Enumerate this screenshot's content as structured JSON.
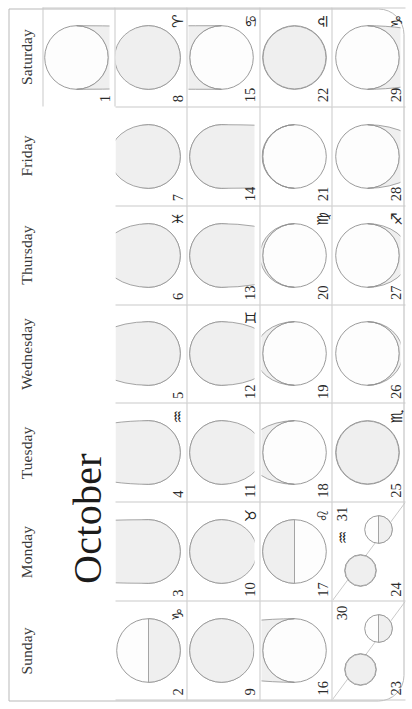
{
  "calendar": {
    "month": "October",
    "weekday_headers": [
      "Sunday",
      "Monday",
      "Tuesday",
      "Wednesday",
      "Thursday",
      "Friday",
      "Saturday"
    ],
    "colors": {
      "grid_line": "#c9c9c9",
      "page_border": "#b9b9b9",
      "moon_outline": "#8f8f8f",
      "moon_shadow_fill": "#efefef",
      "moon_lit_fill": "#fdfdfd",
      "text": "#2a2a2a"
    },
    "weeks": [
      {
        "index": 0,
        "days": [
          {
            "num": "",
            "zodiac": "",
            "blank": true,
            "illum": 0.0,
            "waxing": true,
            "shade": "none"
          },
          {
            "num": "",
            "zodiac": "",
            "blank": true,
            "illum": 0.0,
            "waxing": true,
            "shade": "none"
          },
          {
            "num": "",
            "zodiac": "",
            "blank": true,
            "illum": 0.0,
            "waxing": true,
            "shade": "none"
          },
          {
            "num": "",
            "zodiac": "",
            "blank": true,
            "illum": 0.0,
            "waxing": true,
            "shade": "none"
          },
          {
            "num": "",
            "zodiac": "",
            "blank": true,
            "illum": 0.0,
            "waxing": true,
            "shade": "none"
          },
          {
            "num": "",
            "zodiac": "",
            "blank": true,
            "illum": 0.0,
            "waxing": true,
            "shade": "none"
          },
          {
            "num": "1",
            "zodiac": "",
            "blank": false,
            "illum": 0.56,
            "waxing": false,
            "shade": "bottom"
          }
        ]
      },
      {
        "index": 1,
        "days": [
          {
            "num": "2",
            "zodiac": "♑",
            "blank": false,
            "illum": 0.5,
            "waxing": false,
            "shade": "bottom-half"
          },
          {
            "num": "3",
            "zodiac": "",
            "blank": false,
            "illum": 0.42,
            "waxing": false,
            "shade": "bottom"
          },
          {
            "num": "4",
            "zodiac": "♒",
            "blank": false,
            "illum": 0.33,
            "waxing": false,
            "shade": "bottom"
          },
          {
            "num": "5",
            "zodiac": "",
            "blank": false,
            "illum": 0.24,
            "waxing": false,
            "shade": "bottom"
          },
          {
            "num": "6",
            "zodiac": "♓",
            "blank": false,
            "illum": 0.16,
            "waxing": false,
            "shade": "bottom"
          },
          {
            "num": "7",
            "zodiac": "",
            "blank": false,
            "illum": 0.09,
            "waxing": false,
            "shade": "bottom"
          },
          {
            "num": "8",
            "zodiac": "♈",
            "blank": false,
            "illum": 0.03,
            "waxing": false,
            "shade": "bottom"
          }
        ]
      },
      {
        "index": 2,
        "days": [
          {
            "num": "9",
            "zodiac": "",
            "blank": false,
            "illum": 0.01,
            "waxing": true,
            "shade": "top"
          },
          {
            "num": "10",
            "zodiac": "♉",
            "blank": false,
            "illum": 0.05,
            "waxing": true,
            "shade": "top"
          },
          {
            "num": "11",
            "zodiac": "",
            "blank": false,
            "illum": 0.12,
            "waxing": true,
            "shade": "top"
          },
          {
            "num": "12",
            "zodiac": "♊",
            "blank": false,
            "illum": 0.21,
            "waxing": true,
            "shade": "top"
          },
          {
            "num": "13",
            "zodiac": "",
            "blank": false,
            "illum": 0.31,
            "waxing": true,
            "shade": "top"
          },
          {
            "num": "14",
            "zodiac": "",
            "blank": false,
            "illum": 0.42,
            "waxing": true,
            "shade": "top"
          },
          {
            "num": "15",
            "zodiac": "♋",
            "blank": false,
            "illum": 0.53,
            "waxing": true,
            "shade": "top"
          }
        ]
      },
      {
        "index": 3,
        "days": [
          {
            "num": "16",
            "zodiac": "",
            "blank": false,
            "illum": 0.64,
            "waxing": true,
            "shade": "top"
          },
          {
            "num": "17",
            "zodiac": "♌",
            "blank": false,
            "illum": 0.74,
            "waxing": true,
            "shade": "top-half"
          },
          {
            "num": "18",
            "zodiac": "",
            "blank": false,
            "illum": 0.83,
            "waxing": true,
            "shade": "top"
          },
          {
            "num": "19",
            "zodiac": "",
            "blank": false,
            "illum": 0.9,
            "waxing": true,
            "shade": "top"
          },
          {
            "num": "20",
            "zodiac": "♍",
            "blank": false,
            "illum": 0.96,
            "waxing": true,
            "shade": "top"
          },
          {
            "num": "21",
            "zodiac": "",
            "blank": false,
            "illum": 0.99,
            "waxing": true,
            "shade": "top"
          },
          {
            "num": "22",
            "zodiac": "♎",
            "blank": false,
            "illum": 1.0,
            "waxing": true,
            "shade": "full"
          }
        ]
      },
      {
        "index": 4,
        "days": [
          {
            "num": "23",
            "zodiac": "",
            "blank": false,
            "illum": 0.88,
            "waxing": false,
            "shade": "small",
            "split": true,
            "num2": "30",
            "zodiac2": "",
            "illum2": 0.5,
            "shade2": "bottom-half"
          },
          {
            "num": "24",
            "zodiac": "",
            "blank": false,
            "illum": 0.82,
            "waxing": false,
            "shade": "small",
            "split": true,
            "num2": "31",
            "zodiac2": "♒",
            "illum2": 0.48,
            "shade2": "bottom-half"
          },
          {
            "num": "25",
            "zodiac": "♏",
            "blank": false,
            "illum": 0.99,
            "waxing": false,
            "shade": "full"
          },
          {
            "num": "26",
            "zodiac": "",
            "blank": false,
            "illum": 0.95,
            "waxing": false,
            "shade": "bottom"
          },
          {
            "num": "27",
            "zodiac": "♐",
            "blank": false,
            "illum": 0.88,
            "waxing": false,
            "shade": "bottom"
          },
          {
            "num": "28",
            "zodiac": "",
            "blank": false,
            "illum": 0.78,
            "waxing": false,
            "shade": "bottom"
          },
          {
            "num": "29",
            "zodiac": "♑",
            "blank": false,
            "illum": 0.67,
            "waxing": false,
            "shade": "bottom"
          }
        ]
      }
    ]
  }
}
